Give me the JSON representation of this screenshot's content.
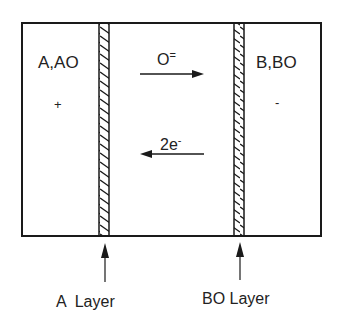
{
  "diagram": {
    "type": "electrochemical-cell-schematic",
    "left_region": {
      "label": "A,AO",
      "sign": "+"
    },
    "right_region": {
      "label": "B,BO",
      "sign": "-"
    },
    "flows": [
      {
        "label_main": "O",
        "label_sup": "=",
        "direction": "right"
      },
      {
        "label_main": "2e",
        "label_sup": "-",
        "direction": "left"
      }
    ],
    "layers": [
      {
        "label": "A  Layer"
      },
      {
        "label": "BO Layer"
      }
    ],
    "colors": {
      "line": "#1a1a1a",
      "background": "#ffffff"
    }
  }
}
